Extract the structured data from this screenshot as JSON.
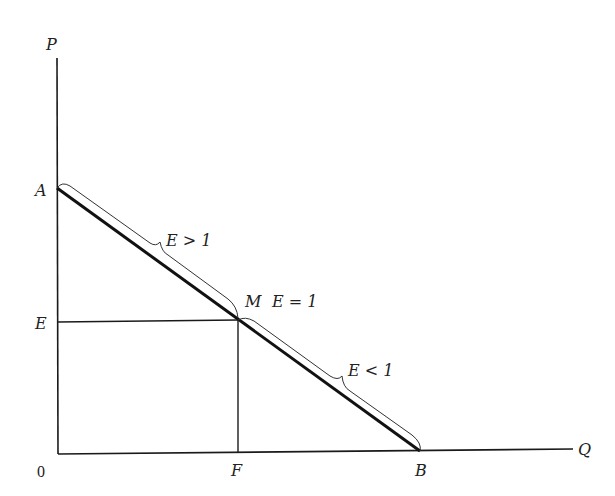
{
  "diagram": {
    "axes": {
      "y_label": "P",
      "x_label": "Q",
      "origin_label": "0"
    },
    "points": {
      "A": "A",
      "E": "E",
      "M": "M",
      "F": "F",
      "B": "B"
    },
    "annotations": {
      "upper_segment": "E > 1",
      "midpoint": "E = 1",
      "lower_segment": "E < 1"
    },
    "colors": {
      "line": "#1a1a1a",
      "background": "#ffffff"
    }
  }
}
